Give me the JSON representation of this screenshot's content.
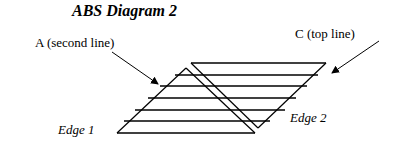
{
  "title": "ABS Diagram 2",
  "labels": {
    "a": "A (second line)",
    "c": "C (top line)",
    "edge1": "Edge 1",
    "edge2": "Edge 2"
  },
  "colors": {
    "stroke": "#000000",
    "background": "#ffffff"
  },
  "geometry": {
    "triangle": {
      "apex": [
        186,
        68
      ],
      "base_left": [
        117,
        133
      ],
      "base_right": [
        255,
        133
      ]
    },
    "parallelogram": {
      "top_left": [
        191,
        63
      ],
      "top_right": [
        326,
        63
      ],
      "bottom": [
        258,
        128
      ]
    },
    "horizontal_lines": [
      {
        "y": 63,
        "x1": 191,
        "x2": 326
      },
      {
        "y": 75,
        "x1": 175,
        "x2": 318
      },
      {
        "y": 86,
        "x1": 160,
        "x2": 307
      },
      {
        "y": 98,
        "x1": 148,
        "x2": 296
      },
      {
        "y": 110,
        "x1": 135,
        "x2": 285
      },
      {
        "y": 121,
        "x1": 124,
        "x2": 270
      },
      {
        "y": 133,
        "x1": 117,
        "x2": 255
      }
    ],
    "arrow_a": {
      "from": [
        112,
        52
      ],
      "to": [
        158,
        84
      ]
    },
    "arrow_c": {
      "from": [
        379,
        41
      ],
      "to": [
        332,
        73
      ]
    }
  }
}
